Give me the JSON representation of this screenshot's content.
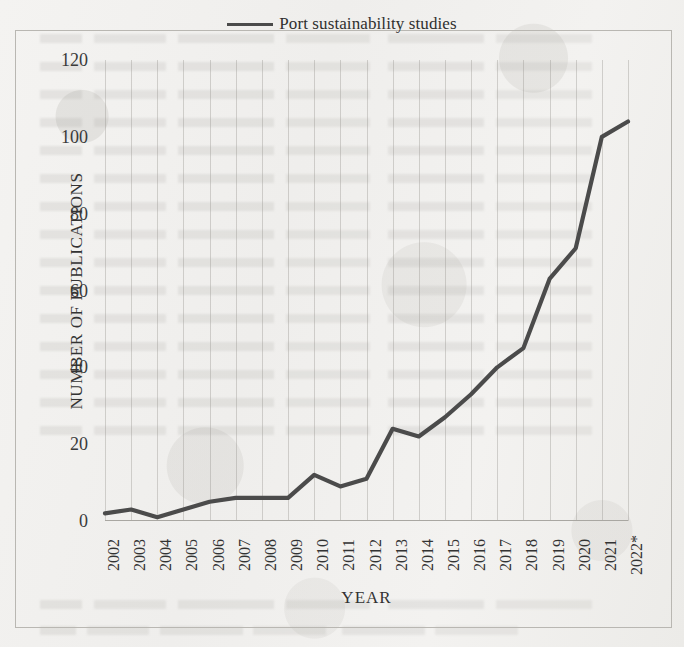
{
  "legend": {
    "entries": [
      {
        "label": "Port sustainability studies",
        "color": "#4b4b4b",
        "marker": "line-swatch"
      }
    ]
  },
  "axes": {
    "y_title": "NUMBER OF PUBLICATIONS",
    "x_title": "YEAR"
  },
  "chart_data": {
    "type": "line",
    "title": "",
    "subtitle": "",
    "xlabel": "YEAR",
    "ylabel": "NUMBER OF PUBLICATIONS",
    "categories": [
      "2002",
      "2003",
      "2004",
      "2005",
      "2006",
      "2007",
      "2008",
      "2009",
      "2010",
      "2011",
      "2012",
      "2013",
      "2014",
      "2015",
      "2016",
      "2017",
      "2018",
      "2019",
      "2020",
      "2021",
      "2022*"
    ],
    "series": [
      {
        "name": "Port sustainability studies",
        "color": "#4b4b4b",
        "values": [
          2,
          3,
          1,
          3,
          5,
          6,
          6,
          6,
          12,
          9,
          11,
          24,
          22,
          27,
          33,
          40,
          45,
          63,
          71,
          100,
          104
        ]
      }
    ],
    "ylim": [
      0,
      120
    ],
    "yticks": [
      0,
      20,
      40,
      60,
      80,
      100,
      120
    ],
    "ytick_labels": [
      "0",
      "20",
      "40",
      "60",
      "80",
      "100",
      "120"
    ],
    "xtick_rotation": -90,
    "grid": {
      "vertical": true,
      "horizontal": false
    },
    "legend_position": "top-center",
    "annotations": [
      {
        "text": "*",
        "applies_to": "2022",
        "meaning": "partial-year marker shown in tick label"
      }
    ]
  }
}
